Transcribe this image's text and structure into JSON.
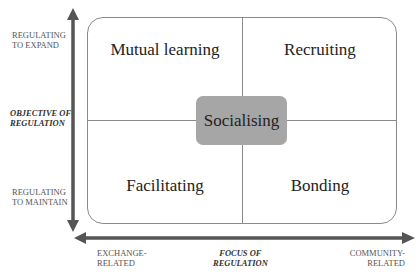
{
  "quadrants": {
    "top_left": "Mutual learning",
    "top_right": "Recruiting",
    "bottom_left": "Facilitating",
    "bottom_right": "Bonding",
    "center": "Socialising"
  },
  "y_axis": {
    "title_line1": "OBJECTIVE OF",
    "title_line2": "REGULATION",
    "top_line1": "REGULATING",
    "top_line2": "TO EXPAND",
    "bottom_line1": "REGULATING",
    "bottom_line2": "TO MAINTAIN"
  },
  "x_axis": {
    "title_line1": "FOCUS OF",
    "title_line2": "REGULATION",
    "left_line1": "EXCHANGE-",
    "left_line2": "RELATED",
    "right_line1": "COMMUNITY-",
    "right_line2": "RELATED"
  },
  "colors": {
    "arrow": "#555555",
    "center_box": "#a6a6a6",
    "border": "#8a8a8a"
  }
}
